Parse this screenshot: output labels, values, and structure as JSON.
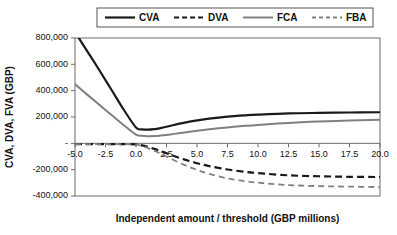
{
  "chart_data": {
    "type": "line",
    "title": "",
    "xlabel": "Independent amount / threshold (GBP millions)",
    "ylabel": "CVA, DVA, FVA (GBP)",
    "xlim": [
      -5.0,
      20.0
    ],
    "ylim": [
      -400000,
      800000
    ],
    "grid": false,
    "legend_position": "top",
    "x_ticks": [
      "-5.0",
      "-2.5",
      "0.0",
      "2.5",
      "5.0",
      "7.5",
      "10.0",
      "12.5",
      "15.0",
      "17.5",
      "20.0"
    ],
    "x_tick_values": [
      -5.0,
      -2.5,
      0.0,
      2.5,
      5.0,
      7.5,
      10.0,
      12.5,
      15.0,
      17.5,
      20.0
    ],
    "y_ticks": [
      "800,000",
      "600,000",
      "400,000",
      "200,000",
      "-",
      "-200,000",
      "-400,000"
    ],
    "y_tick_values": [
      800000,
      600000,
      400000,
      200000,
      0,
      -200000,
      -400000
    ],
    "x": [
      -5.0,
      -4.0,
      -3.0,
      -2.0,
      -1.0,
      0.0,
      0.5,
      1.0,
      1.5,
      2.0,
      2.5,
      3.0,
      4.0,
      5.0,
      6.0,
      7.5,
      9.0,
      10.0,
      12.5,
      15.0,
      17.5,
      20.0
    ],
    "series": [
      {
        "name": "CVA",
        "color": "#1a1a1a",
        "width": 2.2,
        "dash": "none",
        "values": [
          845000,
          700000,
          555000,
          405000,
          255000,
          120000,
          106000,
          104000,
          108000,
          116000,
          126000,
          137000,
          157000,
          174000,
          188000,
          203000,
          213000,
          218000,
          227000,
          231000,
          234000,
          236000
        ]
      },
      {
        "name": "DVA",
        "color": "#1a1a1a",
        "width": 2.2,
        "dash": "7,4",
        "values": [
          -6000,
          -6000,
          -6000,
          -6000,
          -6000,
          -8000,
          -16000,
          -28000,
          -42000,
          -58000,
          -75000,
          -92000,
          -124000,
          -151000,
          -173000,
          -199000,
          -217000,
          -226000,
          -243000,
          -250000,
          -254000,
          -256000
        ]
      },
      {
        "name": "FCA",
        "color": "#808080",
        "width": 2.0,
        "dash": "none",
        "values": [
          450000,
          370000,
          292000,
          215000,
          138000,
          66000,
          57000,
          54000,
          55000,
          59000,
          64000,
          70000,
          83000,
          96000,
          107000,
          121000,
          133000,
          140000,
          155000,
          166000,
          173000,
          179000
        ]
      },
      {
        "name": "FBA",
        "color": "#808080",
        "width": 1.8,
        "dash": "6,4",
        "values": [
          -6000,
          -6000,
          -6000,
          -6000,
          -6000,
          -9000,
          -20000,
          -36000,
          -55000,
          -77000,
          -100000,
          -123000,
          -166000,
          -202000,
          -232000,
          -266000,
          -288000,
          -299000,
          -317000,
          -325000,
          -329000,
          -332000
        ]
      }
    ],
    "legend": [
      {
        "label": "CVA",
        "color": "#1a1a1a",
        "width": 2.2,
        "dash": "none"
      },
      {
        "label": "DVA",
        "color": "#1a1a1a",
        "width": 2.2,
        "dash": "5,3"
      },
      {
        "label": "FCA",
        "color": "#808080",
        "width": 2.0,
        "dash": "none"
      },
      {
        "label": "FBA",
        "color": "#808080",
        "width": 1.8,
        "dash": "4,3"
      }
    ]
  }
}
